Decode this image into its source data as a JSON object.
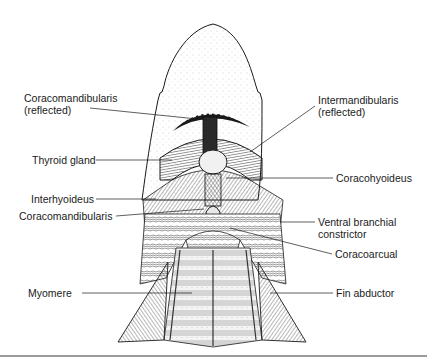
{
  "figure": {
    "labels": {
      "coracomandibularis_reflected": {
        "line1": "Coracomandibularis",
        "line2": "(reflected)"
      },
      "intermandibularis_reflected": {
        "line1": "Intermandibularis",
        "line2": "(reflected)"
      },
      "thyroid_gland": "Thyroid gland",
      "coracohyoideus": "Coracohyoideus",
      "interhyoideus": "Interhyoideus",
      "coracomandibularis": "Coracomandibularis",
      "ventral_branchial_constrictor": {
        "line1": "Ventral branchial",
        "line2": "constrictor"
      },
      "coracoarcual": "Coracoarcual",
      "myomere": "Myomere",
      "fin_abductor": "Fin abductor"
    },
    "colors": {
      "ink": "#1a1a1a",
      "stipple": "#bdbdbd",
      "muscle_fill": "#e9e9e9",
      "rule": "#9a9a9a"
    }
  }
}
